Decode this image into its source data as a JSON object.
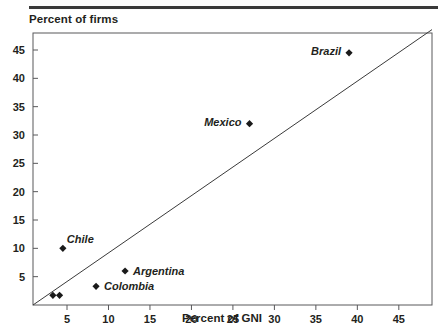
{
  "figure": {
    "y_axis_title": "Percent of firms",
    "x_axis_title": "Percent of GNI"
  },
  "chart_data": {
    "type": "scatter",
    "title": "",
    "xlabel": "Percent of GNI",
    "ylabel": "Percent of firms",
    "xlim": [
      0.9,
      49
    ],
    "ylim": [
      0,
      48
    ],
    "xticks": [
      5,
      10,
      15,
      20,
      25,
      30,
      35,
      40,
      45
    ],
    "yticks": [
      5,
      10,
      15,
      20,
      25,
      30,
      35,
      40,
      45
    ],
    "grid": false,
    "legend": "none",
    "points": [
      {
        "label": "Brazil",
        "x": 39.0,
        "y": 44.5,
        "label_pos": "left"
      },
      {
        "label": "Mexico",
        "x": 27.0,
        "y": 32.0,
        "label_pos": "left"
      },
      {
        "label": "Chile",
        "x": 4.5,
        "y": 10.0,
        "label_pos": "upper-right"
      },
      {
        "label": "Argentina",
        "x": 12.0,
        "y": 6.0,
        "label_pos": "right"
      },
      {
        "label": "Colombia",
        "x": 8.5,
        "y": 3.3,
        "label_pos": "right"
      },
      {
        "label": "",
        "x": 3.3,
        "y": 1.7,
        "label_pos": "none"
      },
      {
        "label": "",
        "x": 4.1,
        "y": 1.7,
        "label_pos": "none"
      }
    ],
    "trendline": {
      "x0": 0.9,
      "y0": 0.0,
      "x1": 49.0,
      "y1": 48.6
    }
  },
  "colors": {
    "ink": "#231f20",
    "rule": "#3a3a3a",
    "axis": "#58585b",
    "marker": "#1a1a1a"
  }
}
